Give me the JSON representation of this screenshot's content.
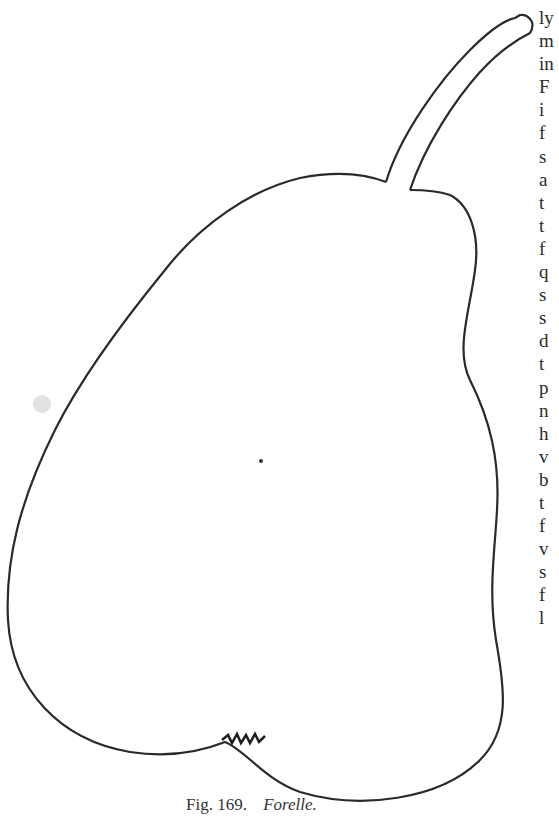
{
  "figure": {
    "caption": {
      "number": "Fig. 169.",
      "name": "Forelle."
    }
  },
  "text_column": {
    "line_starts": [
      "ly",
      "m",
      "in",
      "F",
      "i",
      "f",
      "s",
      "a",
      "t",
      "t",
      "f",
      "q",
      "s",
      "s",
      "d",
      "t",
      "p",
      "n",
      "h",
      "v",
      "b",
      "t",
      "f",
      "v",
      "s",
      "f",
      "l"
    ]
  },
  "colors": {
    "ink": "#2a2a2a",
    "paper": "#ffffff"
  }
}
